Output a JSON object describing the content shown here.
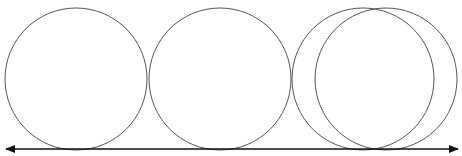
{
  "diagram": {
    "colors": {
      "stroke": "#555555",
      "arrow": "#111111",
      "background": "#ffffff"
    },
    "circles": [
      {
        "cx": 76,
        "cy": 79,
        "r": 71
      },
      {
        "cx": 220,
        "cy": 79,
        "r": 71
      },
      {
        "cx": 363,
        "cy": 79,
        "r": 71
      },
      {
        "cx": 386,
        "cy": 79,
        "r": 71
      }
    ],
    "arrow": {
      "x1": 6,
      "x2": 458,
      "y": 149,
      "heads": "both"
    }
  }
}
